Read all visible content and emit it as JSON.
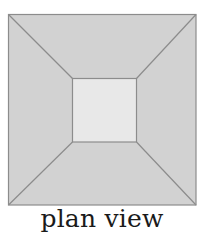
{
  "caption": "plan view",
  "colors": {
    "outer_fill": "#d2d2d2",
    "inner_fill": "#e8e8e8",
    "stroke": "#8c8c8c"
  },
  "geometry": {
    "outer": {
      "x1": 8,
      "y1": 14,
      "x2": 196,
      "y2": 205
    },
    "inner": {
      "x1": 72,
      "y1": 78,
      "x2": 136,
      "y2": 142
    }
  }
}
